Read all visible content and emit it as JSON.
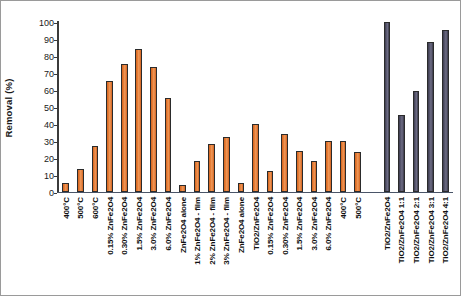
{
  "chart_data": {
    "type": "bar",
    "title": "",
    "xlabel": "",
    "ylabel": "Removal (%)",
    "ylim": [
      0,
      100
    ],
    "ytick_labels": [
      "100",
      "90",
      "80",
      "70",
      "60",
      "50",
      "40",
      "30",
      "20",
      "10",
      "0"
    ],
    "yticks": [
      100,
      90,
      80,
      70,
      60,
      50,
      40,
      30,
      20,
      10,
      0
    ],
    "grid": false,
    "legend": "none",
    "bar_colors": {
      "series_1": "#e07b39",
      "series_2": "#55546b"
    },
    "categories": [
      "400°C",
      "500°C",
      "600°C",
      "0.15% ZnFe2O4",
      "0.30% ZnFe2O4",
      "1.5% ZnFe2O4",
      "3.0% ZnFe2O4",
      "6.0% ZnFe2O4",
      "ZnFe2O4 alone",
      "1% ZnFe2O4 - film",
      "2% ZnFe2O4 - film",
      "3% ZnFe2O4 - film",
      "ZnFe2O4 alone",
      "TiO2/ZnFe2O4",
      "0.15% ZnFe2O4",
      "0.30% ZnFe2O4",
      "1.5% ZnFe2O4",
      "3.0% ZnFe2O4",
      "6.0% ZnFe2O4",
      "400°C",
      "500°C",
      "600°C",
      "TiO2/ZnFe2O4",
      "TiO2/ZnFe2O4 1:1",
      "TiO2/ZnFe2O4 2:1",
      "TiO2/ZnFe2O4 3:1",
      "TiO2/ZnFe2O4 4:1"
    ],
    "values": [
      5,
      13,
      27,
      65,
      75,
      84,
      73,
      55,
      4,
      18,
      28,
      32,
      5,
      40,
      12,
      34,
      24,
      18,
      30,
      30,
      23,
      null,
      100,
      45,
      59,
      88,
      95
    ],
    "group_of": [
      "a",
      "a",
      "a",
      "a",
      "a",
      "a",
      "a",
      "a",
      "a",
      "a",
      "a",
      "a",
      "a",
      "a",
      "a",
      "a",
      "a",
      "a",
      "a",
      "a",
      "a",
      "gap",
      "b",
      "b",
      "b",
      "b",
      "b"
    ]
  }
}
